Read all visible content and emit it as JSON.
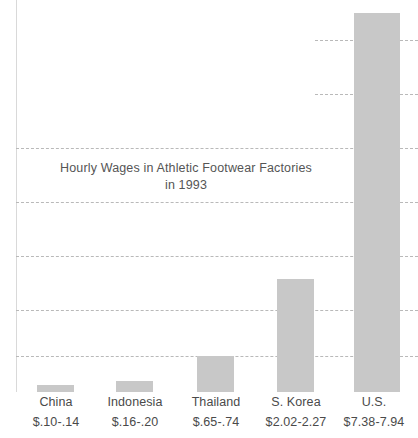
{
  "chart_data": {
    "type": "bar",
    "title": "Hourly Wages in Athletic Footwear Factories\nin 1993",
    "title_line1": "Hourly Wages in Athletic Footwear Factories",
    "title_line2": "in 1993",
    "xlabel": "",
    "ylabel": "",
    "ylim": [
      0,
      8.5
    ],
    "grid": true,
    "grid_axis": "y",
    "gridline_style": "dashed",
    "legend": "none",
    "bar_color": "#c8c8c8",
    "gridline_color": "#b9b9b9",
    "background_color": "#ffffff",
    "text_color": "#4a4a4a",
    "categories": [
      "China",
      "Indonesia",
      "Thailand",
      "S. Korea",
      "U.S."
    ],
    "values": [
      0.12,
      0.18,
      0.695,
      2.145,
      7.66
    ],
    "value_labels": [
      "$.10-.14",
      "$.16-.20",
      "$.65-.74",
      "$2.02-2.27",
      "$7.38-7.94"
    ],
    "ranges": [
      {
        "category": "China",
        "low": 0.1,
        "high": 0.14,
        "label": "$.10-.14"
      },
      {
        "category": "Indonesia",
        "low": 0.16,
        "high": 0.2,
        "label": "$.16-.20"
      },
      {
        "category": "Thailand",
        "low": 0.65,
        "high": 0.74,
        "label": "$.65-.74"
      },
      {
        "category": "S. Korea",
        "low": 2.02,
        "high": 2.27,
        "label": "$2.02-2.27"
      },
      {
        "category": "U.S.",
        "low": 7.38,
        "high": 7.94,
        "label": "$7.38-7.94"
      }
    ],
    "yticks": [
      1.0,
      2.0,
      3.0,
      4.0,
      5.0,
      6.0,
      7.0
    ],
    "ytick_labels": [
      "",
      "",
      "",
      "",
      "",
      "",
      ""
    ]
  },
  "layout": {
    "gridlines_px": [
      {
        "y": 40,
        "left": 315,
        "right": 418
      },
      {
        "y": 94,
        "left": 315,
        "right": 418
      },
      {
        "y": 148,
        "left": 16,
        "right": 418
      },
      {
        "y": 202,
        "left": 16,
        "right": 418
      },
      {
        "y": 256,
        "left": 16,
        "right": 418
      },
      {
        "y": 310,
        "left": 16,
        "right": 418
      },
      {
        "y": 356,
        "left": 16,
        "right": 418
      }
    ],
    "bars_px": [
      {
        "left": 37,
        "width": 37,
        "top": 385
      },
      {
        "left": 116,
        "width": 37,
        "top": 381
      },
      {
        "left": 197,
        "width": 37,
        "top": 356
      },
      {
        "left": 277,
        "width": 37,
        "top": 279
      },
      {
        "left": 354,
        "width": 46,
        "top": 13
      }
    ],
    "xlabels_px": [
      {
        "left": 12,
        "width": 88
      },
      {
        "left": 90,
        "width": 90
      },
      {
        "left": 171,
        "width": 90
      },
      {
        "left": 247,
        "width": 98
      },
      {
        "left": 330,
        "width": 88
      }
    ]
  }
}
